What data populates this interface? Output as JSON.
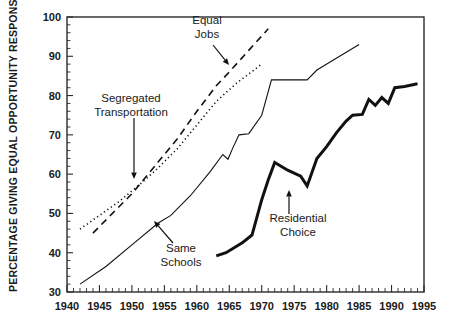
{
  "chart_data": {
    "type": "line",
    "title": "",
    "xlabel": "",
    "ylabel": "PERCENTAGE GIVING EQUAL OPPORTUNITY RESPONSE",
    "xlim": [
      1940,
      1995
    ],
    "ylim": [
      30,
      100
    ],
    "xticks": [
      1940,
      1945,
      1950,
      1955,
      1960,
      1965,
      1970,
      1975,
      1980,
      1985,
      1990,
      1995
    ],
    "xtick_labels": [
      "1940",
      "1945",
      "1950",
      "1955",
      "1960",
      "1965",
      "1970",
      "1975",
      "1980",
      "1985",
      "1990",
      "1995"
    ],
    "x_minor_step": 1,
    "yticks": [
      30,
      40,
      50,
      60,
      70,
      80,
      90,
      100
    ],
    "ytick_labels": [
      "30",
      "40",
      "50",
      "60",
      "70",
      "80",
      "90",
      "100"
    ],
    "y_minor_step": 2,
    "grid": false,
    "legend": "in-plot annotations with arrows",
    "series": [
      {
        "name": "Equal Jobs",
        "style": "dashed",
        "stroke_width": 1.6,
        "dash": "7,5",
        "points": [
          [
            1944,
            45.0
          ],
          [
            1947,
            50.0
          ],
          [
            1950,
            55.0
          ],
          [
            1951.5,
            58.0
          ],
          [
            1954,
            63.0
          ],
          [
            1957,
            69.0
          ],
          [
            1960,
            76.0
          ],
          [
            1963,
            82.5
          ],
          [
            1965,
            86.0
          ],
          [
            1968,
            91.5
          ],
          [
            1971,
            97.0
          ]
        ]
      },
      {
        "name": "Segregated Transportation",
        "style": "dotted",
        "stroke_width": 1.6,
        "dash": "1.2,3",
        "points": [
          [
            1942,
            46.0
          ],
          [
            1945,
            49.5
          ],
          [
            1948,
            53.0
          ],
          [
            1951.5,
            57.8
          ],
          [
            1954,
            61.5
          ],
          [
            1957,
            66.5
          ],
          [
            1960,
            72.5
          ],
          [
            1963,
            78.5
          ],
          [
            1966,
            83.0
          ],
          [
            1968,
            85.5
          ],
          [
            1970,
            88.0
          ]
        ]
      },
      {
        "name": "Same Schools",
        "style": "solid-thin",
        "stroke_width": 1.1,
        "dash": "",
        "points": [
          [
            1942,
            32.0
          ],
          [
            1946,
            36.5
          ],
          [
            1950,
            42.0
          ],
          [
            1954,
            47.5
          ],
          [
            1956,
            49.5
          ],
          [
            1959,
            54.5
          ],
          [
            1962,
            60.5
          ],
          [
            1964,
            65.0
          ],
          [
            1964.8,
            63.8
          ],
          [
            1965.5,
            66.5
          ],
          [
            1966.5,
            70.0
          ],
          [
            1968,
            70.3
          ],
          [
            1970,
            75.0
          ],
          [
            1971.5,
            84.0
          ],
          [
            1975,
            84.0
          ],
          [
            1977,
            84.0
          ],
          [
            1978.5,
            86.5
          ],
          [
            1982,
            90.0
          ],
          [
            1985,
            93.0
          ]
        ]
      },
      {
        "name": "Residential Choice",
        "style": "solid-thick",
        "stroke_width": 3.0,
        "dash": "",
        "points": [
          [
            1963,
            39.2
          ],
          [
            1964.5,
            40.0
          ],
          [
            1967,
            42.5
          ],
          [
            1968.5,
            44.5
          ],
          [
            1970,
            53.5
          ],
          [
            1971,
            58.5
          ],
          [
            1972,
            63.0
          ],
          [
            1974,
            61.0
          ],
          [
            1976,
            59.5
          ],
          [
            1977,
            57.0
          ],
          [
            1978.5,
            64.0
          ],
          [
            1980,
            67.0
          ],
          [
            1981.5,
            70.5
          ],
          [
            1983,
            73.5
          ],
          [
            1984,
            75.0
          ],
          [
            1985.5,
            75.2
          ],
          [
            1986.5,
            79.0
          ],
          [
            1987.5,
            77.5
          ],
          [
            1988.5,
            79.5
          ],
          [
            1989.5,
            78.0
          ],
          [
            1990.5,
            82.0
          ],
          [
            1992,
            82.3
          ],
          [
            1994,
            83.0
          ]
        ]
      }
    ],
    "annotations": [
      {
        "id": "equal-jobs",
        "lines": [
          "Equal",
          "Jobs"
        ],
        "text_x": 207,
        "text_y": 24,
        "arrow": {
          "x1": 213,
          "y1": 45,
          "x2": 229,
          "y2": 65
        },
        "anchor": "middle"
      },
      {
        "id": "segregated-transportation",
        "lines": [
          "Segregated",
          "Transportation"
        ],
        "text_x": 131,
        "text_y": 102,
        "arrow": {
          "x1": 134,
          "y1": 118,
          "x2": 134,
          "y2": 179
        },
        "anchor": "middle"
      },
      {
        "id": "same-schools",
        "lines": [
          "Same",
          "Schools"
        ],
        "text_x": 181,
        "text_y": 252,
        "arrow": {
          "x1": 173,
          "y1": 243,
          "x2": 154,
          "y2": 221
        },
        "anchor": "middle"
      },
      {
        "id": "residential-choice",
        "lines": [
          "Residential",
          "Choice"
        ],
        "text_x": 298,
        "text_y": 222,
        "arrow": {
          "x1": 289,
          "y1": 214,
          "x2": 289,
          "y2": 190
        },
        "anchor": "middle"
      }
    ]
  },
  "colors": {
    "axis": "#2b2b2b",
    "line": "#111111",
    "background": "#ffffff",
    "text": "#1a1a1a"
  }
}
